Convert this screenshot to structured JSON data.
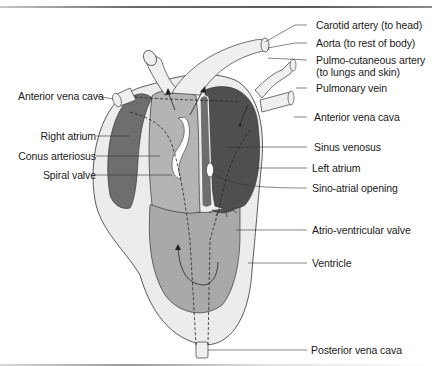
{
  "diagram": {
    "colors": {
      "outer_wall": "#ececec",
      "right_atrium": "#6e6e6e",
      "left_atrium": "#4f4f4f",
      "ventricle": "#a9a9a9",
      "conus": "#b4b4b4",
      "vessels": "#efefef",
      "outline": "#333333"
    },
    "labels_left": [
      {
        "text": "Anterior vena cava"
      },
      {
        "text": "Right atrium"
      },
      {
        "text": "Conus arteriosus"
      },
      {
        "text": "Spiral valve"
      }
    ],
    "labels_right": [
      {
        "text": "Carotid artery (to head)"
      },
      {
        "text": "Aorta (to rest of body)"
      },
      {
        "text": "Pulmo-cutaneous artery"
      },
      {
        "text": "(to lungs and skin)"
      },
      {
        "text": "Pulmonary vein"
      },
      {
        "text": "Anterior vena cava"
      },
      {
        "text": "Sinus venosus"
      },
      {
        "text": "Left atrium"
      },
      {
        "text": "Sino-atrial opening"
      },
      {
        "text": "Atrio-ventricular valve"
      },
      {
        "text": "Ventricle"
      },
      {
        "text": "Posterior vena cava"
      }
    ]
  }
}
